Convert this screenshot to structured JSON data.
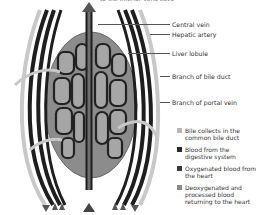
{
  "diagram": {
    "top_caption": "to the inferior vena cava",
    "labels": [
      {
        "text": "Central vein",
        "y": 21
      },
      {
        "text": "Hepatic artery",
        "y": 31
      },
      {
        "text": "Liver lobule",
        "y": 50
      },
      {
        "text": "Branch of bile duct",
        "y": 73
      },
      {
        "text": "Branch of portal vein",
        "y": 99
      }
    ],
    "legend": [
      {
        "text": "Bile collects in the common bile duct",
        "color": "#b8b8b8"
      },
      {
        "text": "Blood from the digestive system",
        "color": "#2a2a2a"
      },
      {
        "text": "Oxygenated blood from the heart",
        "color": "#3a3a3a"
      },
      {
        "text": "Deoxygenated and processed blood returning to the heart",
        "color": "#8a8a8a"
      }
    ],
    "colors": {
      "lobule": "#8c8c8c",
      "cell": "#a3a3a3",
      "vessel_dark": "#1e1e1e",
      "vessel_mid": "#6e6e6e",
      "vessel_light": "#c8c8c8"
    }
  }
}
